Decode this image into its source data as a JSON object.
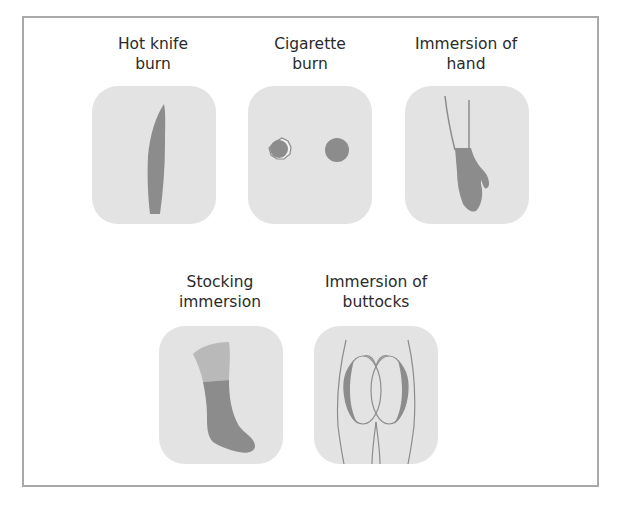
{
  "figure": {
    "items": [
      {
        "id": "hot-knife-burn",
        "label_line1": "Hot knife",
        "label_line2": "burn"
      },
      {
        "id": "cigarette-burn",
        "label_line1": "Cigarette",
        "label_line2": "burn"
      },
      {
        "id": "immersion-of-hand",
        "label_line1": "Immersion of",
        "label_line2": "hand"
      },
      {
        "id": "stocking-immersion",
        "label_line1": "Stocking",
        "label_line2": "immersion"
      },
      {
        "id": "immersion-of-buttocks",
        "label_line1": "Immersion of",
        "label_line2": "buttocks"
      }
    ],
    "colors": {
      "tile": "#e3e3e3",
      "burn": "#8c8c8c",
      "light_burn": "#b9b9b9",
      "frame": "#a9a9a9",
      "text": "#2a2a2a"
    }
  }
}
